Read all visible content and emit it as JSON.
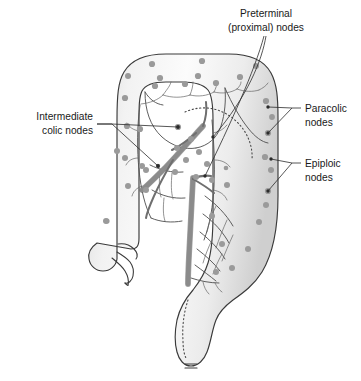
{
  "figure": {
    "background_color": "#ffffff",
    "ink_color": "#1a1a1a",
    "node_color": "#9a9a9a",
    "vessel_color": "#8b8b8b",
    "gut_outline_color": "#3a3a3a"
  },
  "labels": {
    "preterminal": {
      "line1": "Preterminal",
      "line2": "(proximal) nodes",
      "align": "middle",
      "x": 266,
      "y1": 17,
      "y2": 31
    },
    "intermediate": {
      "line1": "Intermediate",
      "line2": "colic nodes",
      "align": "end",
      "x": 93,
      "y1": 120,
      "y2": 134
    },
    "paracolic": {
      "line1": "Paracolic",
      "line2": "nodes",
      "align": "start",
      "x": 305,
      "y1": 108,
      "y2": 122
    },
    "epiploic": {
      "line1": "Epiploic",
      "line2": "nodes",
      "align": "start",
      "x": 305,
      "y1": 163,
      "y2": 177
    }
  },
  "anatomy": {
    "parts": [
      "transverse colon",
      "ascending colon",
      "descending colon",
      "sigmoid colon",
      "cecum",
      "appendix",
      "rectum",
      "anal canal",
      "superior mesenteric artery",
      "inferior mesenteric artery",
      "marginal artery"
    ]
  },
  "node_counts": {
    "paracolic": 22,
    "epiploic": 9,
    "intermediate": 12,
    "preterminal": 7
  }
}
